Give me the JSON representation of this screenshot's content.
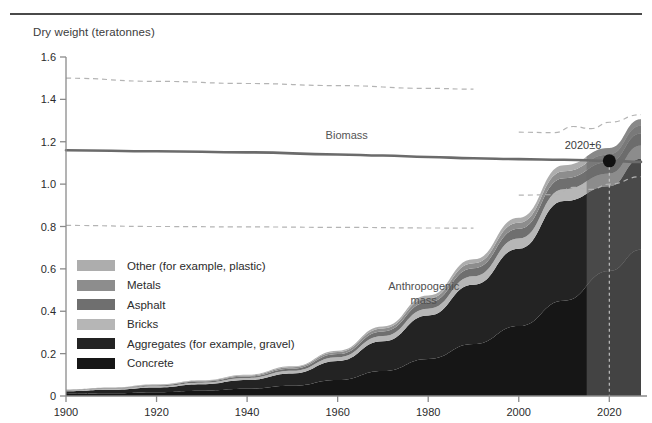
{
  "chart_data": {
    "type": "area",
    "title": "",
    "ylabel": "Dry weight (teratonnes)",
    "xlabel": "",
    "xlim": [
      1900,
      2027
    ],
    "ylim": [
      0,
      1.6
    ],
    "grid": false,
    "legend_position": "inside-left",
    "y_ticks": [
      "0",
      "0.2",
      "0.4",
      "0.6",
      "0.8",
      "1.0",
      "1.2",
      "1.4",
      "1.6"
    ],
    "y_tick_values": [
      0,
      0.2,
      0.4,
      0.6,
      0.8,
      1.0,
      1.2,
      1.4,
      1.6
    ],
    "x_ticks": [
      "1900",
      "1920",
      "1940",
      "1960",
      "1980",
      "2000",
      "2020"
    ],
    "x_tick_values": [
      1900,
      1920,
      1940,
      1960,
      1980,
      2000,
      2020
    ],
    "annotations": [
      {
        "name": "crossover-point",
        "text": "2020±6",
        "x": 2020,
        "y": 1.11
      },
      {
        "name": "biomass-label",
        "text": "Biomass",
        "x": 1962,
        "y": 1.215
      },
      {
        "name": "anthropogenic-label-line1",
        "text": "Anthropogenic",
        "x": 1979,
        "y": 0.5
      },
      {
        "name": "anthropogenic-label-line2",
        "text": "mass",
        "x": 1979,
        "y": 0.435
      }
    ],
    "series": [
      {
        "name": "Biomass",
        "type": "line",
        "color": "#6b6b6b",
        "x": [
          1900,
          1920,
          1940,
          1960,
          1970,
          1980,
          1990,
          2000,
          2010,
          2020,
          2027
        ],
        "values": [
          1.16,
          1.155,
          1.15,
          1.14,
          1.135,
          1.128,
          1.122,
          1.118,
          1.115,
          1.11,
          1.105
        ]
      },
      {
        "name": "Biomass upper uncertainty",
        "type": "dashed-line",
        "color": "#b4b4b4",
        "x": [
          1900,
          1920,
          1940,
          1960,
          1980,
          1990
        ],
        "values": [
          1.5,
          1.485,
          1.475,
          1.465,
          1.452,
          1.448
        ]
      },
      {
        "name": "Biomass upper uncertainty continued",
        "type": "dashed-line",
        "color": "#b4b4b4",
        "x": [
          2000,
          2008,
          2012,
          2016,
          2020,
          2027
        ],
        "values": [
          1.245,
          1.243,
          1.272,
          1.262,
          1.292,
          1.328
        ]
      },
      {
        "name": "Biomass lower uncertainty",
        "type": "dashed-line",
        "color": "#b4b4b4",
        "x": [
          1900,
          1920,
          1940,
          1960,
          1980,
          1990
        ],
        "values": [
          0.805,
          0.8,
          0.798,
          0.796,
          0.793,
          0.792
        ]
      },
      {
        "name": "Biomass lower uncertainty continued",
        "type": "dashed-line",
        "color": "#b4b4b4",
        "x": [
          2000,
          2008,
          2012,
          2016,
          2020,
          2027
        ],
        "values": [
          0.948,
          0.95,
          0.985,
          0.975,
          1.0,
          1.035
        ]
      }
    ],
    "stack": {
      "name": "Anthropogenic mass",
      "x": [
        1900,
        1910,
        1920,
        1930,
        1940,
        1950,
        1960,
        1970,
        1980,
        1990,
        2000,
        2010,
        2020,
        2027
      ],
      "layers": [
        {
          "name": "Concrete",
          "color": "#161616",
          "values": [
            0.01,
            0.013,
            0.018,
            0.025,
            0.034,
            0.048,
            0.075,
            0.118,
            0.175,
            0.245,
            0.33,
            0.45,
            0.59,
            0.69
          ]
        },
        {
          "name": "Aggregates (for example, gravel)",
          "color": "#232323",
          "values": [
            0.012,
            0.016,
            0.022,
            0.03,
            0.041,
            0.058,
            0.09,
            0.14,
            0.205,
            0.28,
            0.365,
            0.47,
            0.4,
            0.43
          ]
        },
        {
          "name": "Bricks",
          "color": "#b6b6b6",
          "values": [
            0.004,
            0.005,
            0.006,
            0.008,
            0.01,
            0.013,
            0.018,
            0.025,
            0.032,
            0.04,
            0.048,
            0.056,
            0.06,
            0.062
          ]
        },
        {
          "name": "Asphalt",
          "color": "#6f6f6f",
          "values": [
            0.002,
            0.003,
            0.004,
            0.005,
            0.007,
            0.01,
            0.015,
            0.022,
            0.03,
            0.038,
            0.046,
            0.052,
            0.055,
            0.057
          ]
        },
        {
          "name": "Metals",
          "color": "#8d8d8d",
          "values": [
            0.002,
            0.002,
            0.003,
            0.004,
            0.005,
            0.007,
            0.01,
            0.014,
            0.019,
            0.024,
            0.029,
            0.033,
            0.035,
            0.036
          ]
        },
        {
          "name": "Other (for example, plastic)",
          "color": "#adadad",
          "values": [
            0.001,
            0.001,
            0.002,
            0.002,
            0.003,
            0.004,
            0.006,
            0.009,
            0.013,
            0.018,
            0.023,
            0.028,
            0.03,
            0.031
          ]
        }
      ]
    },
    "projection_band": {
      "name": "projection-shading",
      "from": 2015,
      "to": 2027,
      "color": "#6a6a6a"
    },
    "marker_line": {
      "name": "year-2020-marker",
      "x": 2020
    }
  },
  "legend": {
    "items": [
      {
        "label": "Other (for example, plastic)",
        "color": "#adadad"
      },
      {
        "label": "Metals",
        "color": "#8d8d8d"
      },
      {
        "label": "Asphalt",
        "color": "#6f6f6f"
      },
      {
        "label": "Bricks",
        "color": "#b6b6b6"
      },
      {
        "label": "Aggregates (for example, gravel)",
        "color": "#232323"
      },
      {
        "label": "Concrete",
        "color": "#161616"
      }
    ]
  }
}
